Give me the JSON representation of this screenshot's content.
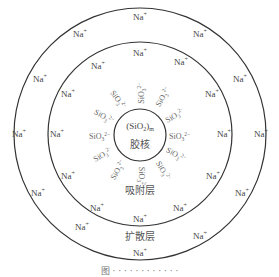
{
  "diagram": {
    "core_formula": "(SiO",
    "core_formula_sub": "2",
    "core_formula_close": ")",
    "core_formula_m": "m",
    "core_label": "胶核",
    "adsorption_label": "吸附层",
    "diffusion_label": "扩散层",
    "cation": "Na",
    "cation_charge": "+",
    "anion": "SiO",
    "anion_sub": "3",
    "anion_charge": "2−",
    "colors": {
      "line": "#333333",
      "text": "#444444",
      "anion_text": "#666666"
    }
  },
  "caption": "图 · · · · · · · · · · · ·",
  "rings": {
    "outer": {
      "cx": 140,
      "cy": 134,
      "r": 126
    },
    "middle": {
      "cx": 140,
      "cy": 134,
      "r": 92
    },
    "inner": {
      "cx": 140,
      "cy": 135,
      "r": 26
    }
  }
}
